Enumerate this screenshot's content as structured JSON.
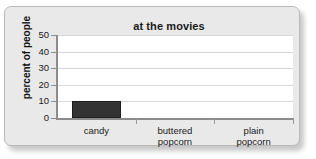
{
  "card": {
    "background_color": "#e9e9e9",
    "border_color": "#b9b9b9"
  },
  "chart_data": {
    "type": "bar",
    "title": "at the movies",
    "xlabel": "",
    "ylabel": "percent of people",
    "categories": [
      "candy",
      "buttered popcorn",
      "plain popcorn"
    ],
    "category_lines": [
      [
        "candy"
      ],
      [
        "buttered",
        "popcorn"
      ],
      [
        "plain",
        "popcorn"
      ]
    ],
    "values": [
      10,
      0,
      0
    ],
    "ylim": [
      0,
      50
    ],
    "yticks": [
      0,
      10,
      20,
      30,
      40,
      50
    ],
    "ytick_labels": [
      "0",
      "10",
      "20",
      "30",
      "40",
      "50"
    ],
    "grid": true,
    "legend": false,
    "bar_color": "#333333",
    "gridline_color": "#d8d8d8",
    "axis_color": "#8c8c8c",
    "plot_background": "#ffffff"
  }
}
